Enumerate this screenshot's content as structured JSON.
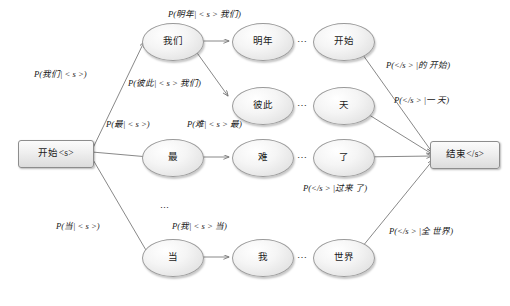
{
  "diagram": {
    "colors": {
      "node_border": "#9a9a9a",
      "node_fill_light": "#ffffff",
      "node_fill_dark": "#d5d5d5",
      "terminal_border": "#8d8d8d",
      "edge_stroke": "#7a7a7a",
      "text": "#161616",
      "background": "#ffffff"
    },
    "terminals": {
      "start": "开始<s>",
      "end": "结束</s>"
    },
    "rows": [
      {
        "id": "row-1",
        "nodes": [
          {
            "id": "n-women",
            "label": "我们"
          },
          {
            "id": "n-mingnian",
            "label": "明年"
          },
          {
            "id": "n-kaishi",
            "label": "开始"
          }
        ],
        "ellipsis": "⋯"
      },
      {
        "id": "row-2",
        "nodes": [
          {
            "id": "n-bici",
            "label": "彼此"
          },
          {
            "id": "n-tian",
            "label": "天"
          }
        ],
        "ellipsis": "⋯"
      },
      {
        "id": "row-3",
        "nodes": [
          {
            "id": "n-zui",
            "label": "最"
          },
          {
            "id": "n-nan",
            "label": "难"
          },
          {
            "id": "n-le",
            "label": "了"
          }
        ],
        "ellipsis": "⋯"
      },
      {
        "id": "row-4",
        "nodes": [
          {
            "id": "n-dang",
            "label": "当"
          },
          {
            "id": "n-wo",
            "label": "我"
          },
          {
            "id": "n-shijie",
            "label": "世界"
          }
        ],
        "ellipsis": "⋯"
      }
    ],
    "vertical_ellipsis": "⋮",
    "edge_labels": [
      {
        "id": "lbl-start-women",
        "text": "P(我们| < s >)"
      },
      {
        "id": "lbl-women-mingnian",
        "text": "P(明年| < s > 我们)"
      },
      {
        "id": "lbl-women-bici",
        "text": "P(彼此| < s > 我们)"
      },
      {
        "id": "lbl-start-zui",
        "text": "P(最| < s >)"
      },
      {
        "id": "lbl-zui-nan",
        "text": "P(难| < s > 最)"
      },
      {
        "id": "lbl-start-dang",
        "text": "P(当| < s >)"
      },
      {
        "id": "lbl-dang-wo",
        "text": "P(我| < s > 当)"
      },
      {
        "id": "lbl-kaishi-end",
        "text": "P(</s > |的 开始)"
      },
      {
        "id": "lbl-tian-end",
        "text": "P(</s > |一 天)"
      },
      {
        "id": "lbl-le-end",
        "text": "P(</s > |过来 了)"
      },
      {
        "id": "lbl-shijie-end",
        "text": "P(</s > |全 世界)"
      }
    ]
  }
}
